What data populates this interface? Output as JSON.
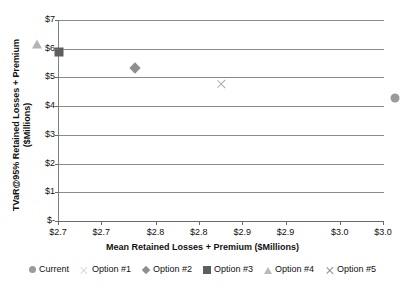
{
  "chart_data": {
    "type": "scatter",
    "title": "",
    "xlabel": "Mean Retained Losses + Premium ($Millions)",
    "ylabel_line1": "TVaR@95% Retained Losses + Premium",
    "ylabel_line2": "($Millions)",
    "xlim": [
      2.7,
      3.0
    ],
    "ylim": [
      0,
      7
    ],
    "grid": true,
    "legend_position": "bottom",
    "x_tick_labels": [
      "$2.7",
      "$2.7",
      "$2.8",
      "$2.8",
      "$2.9",
      "$2.9",
      "$3.0",
      "$3.0"
    ],
    "x_tick_values": [
      2.7,
      2.74,
      2.79,
      2.83,
      2.87,
      2.91,
      2.96,
      3.0
    ],
    "y_tick_labels": [
      "$7",
      "$6",
      "$5",
      "$4",
      "$3",
      "$2",
      "$1",
      "$-"
    ],
    "y_tick_values": [
      7,
      6,
      5,
      4,
      3,
      2,
      1,
      0
    ],
    "series": [
      {
        "name": "Current",
        "marker": "circle",
        "color": "#9a9a9a",
        "points": [
          {
            "x": 3.01,
            "y": 4.27
          }
        ]
      },
      {
        "name": "Option #1",
        "marker": "x-faint",
        "color": "#d8d8d8",
        "points": []
      },
      {
        "name": "Option #2",
        "marker": "diamond",
        "color": "#8f8f8f",
        "points": [
          {
            "x": 2.77,
            "y": 5.33
          }
        ]
      },
      {
        "name": "Option #3",
        "marker": "square",
        "color": "#5e5e5e",
        "points": [
          {
            "x": 2.7,
            "y": 5.89
          }
        ]
      },
      {
        "name": "Option #4",
        "marker": "triangle",
        "color": "#b4b4b4",
        "points": [
          {
            "x": 2.68,
            "y": 6.15
          }
        ]
      },
      {
        "name": "Option #5",
        "marker": "x",
        "color": "#a8a8a8",
        "points": [
          {
            "x": 2.85,
            "y": 4.78
          }
        ]
      }
    ]
  },
  "legend": {
    "items": [
      {
        "label": "Current",
        "marker": "circle"
      },
      {
        "label": "Option #1",
        "marker": "x-faint"
      },
      {
        "label": "Option #2",
        "marker": "diamond"
      },
      {
        "label": "Option #3",
        "marker": "square"
      },
      {
        "label": "Option #4",
        "marker": "triangle"
      },
      {
        "label": "Option #5",
        "marker": "x"
      }
    ]
  },
  "axes": {
    "x_title": "Mean Retained Losses + Premium ($Millions)",
    "y_title_line1": "TVaR@95% Retained Losses + Premium",
    "y_title_line2": "($Millions)"
  },
  "colors": {
    "gridline": "#8a8a8a",
    "axis": "#6a6a6a",
    "text": "#111111"
  }
}
